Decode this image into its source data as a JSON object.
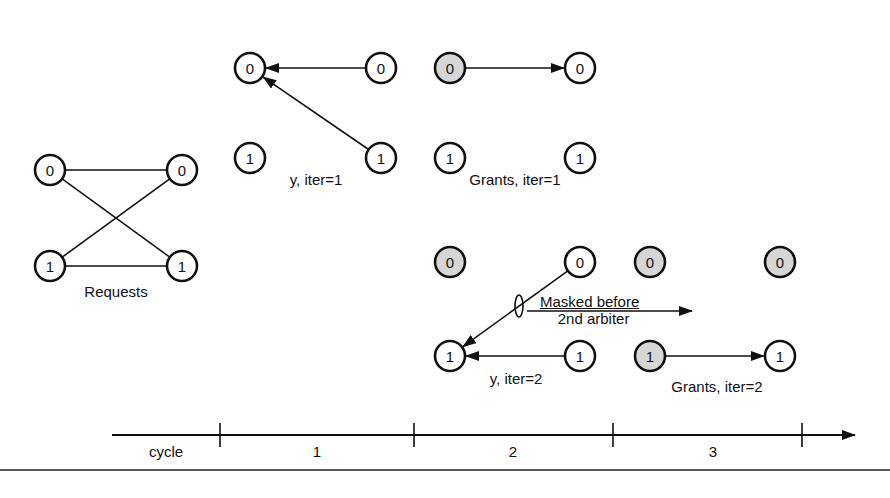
{
  "figure": {
    "colors": {
      "stroke": "#111111",
      "node_fill": "#ffffff",
      "node_granted_fill": "#d6d6d6",
      "background": "#ffffff"
    },
    "panels": [
      {
        "id": "requests",
        "label": "Requests",
        "nodes": [
          {
            "id": "req-in-0",
            "text": "0",
            "x": 50,
            "y": 170,
            "shaded": false
          },
          {
            "id": "req-out-0",
            "text": "0",
            "x": 182,
            "y": 170,
            "shaded": false
          },
          {
            "id": "req-in-1",
            "text": "1",
            "x": 50,
            "y": 266,
            "shaded": false
          },
          {
            "id": "req-out-1",
            "text": "1",
            "x": 182,
            "y": 266,
            "shaded": false
          }
        ],
        "edges": [
          {
            "from": "req-in-0",
            "to": "req-out-0",
            "arrow": false
          },
          {
            "from": "req-in-0",
            "to": "req-out-1",
            "arrow": false
          },
          {
            "from": "req-in-1",
            "to": "req-out-0",
            "arrow": false
          },
          {
            "from": "req-in-1",
            "to": "req-out-1",
            "arrow": false
          }
        ],
        "label_pos": {
          "x": 116,
          "y": 293
        }
      },
      {
        "id": "y-iter1",
        "label": "y, iter=1",
        "nodes": [
          {
            "id": "y1-l0",
            "text": "0",
            "x": 250,
            "y": 68,
            "shaded": false
          },
          {
            "id": "y1-r0",
            "text": "0",
            "x": 381,
            "y": 68,
            "shaded": false
          },
          {
            "id": "y1-l1",
            "text": "1",
            "x": 250,
            "y": 158,
            "shaded": false
          },
          {
            "id": "y1-r1",
            "text": "1",
            "x": 381,
            "y": 158,
            "shaded": false
          }
        ],
        "edges": [
          {
            "from": "y1-r0",
            "to": "y1-l0",
            "arrow": true
          },
          {
            "from": "y1-r1",
            "to": "y1-l0",
            "arrow": true
          }
        ],
        "label_pos": {
          "x": 316,
          "y": 181
        }
      },
      {
        "id": "grants-iter1",
        "label": "Grants, iter=1",
        "nodes": [
          {
            "id": "g1-l0",
            "text": "0",
            "x": 450,
            "y": 68,
            "shaded": true
          },
          {
            "id": "g1-r0",
            "text": "0",
            "x": 580,
            "y": 68,
            "shaded": false
          },
          {
            "id": "g1-l1",
            "text": "1",
            "x": 450,
            "y": 158,
            "shaded": false
          },
          {
            "id": "g1-r1",
            "text": "1",
            "x": 580,
            "y": 158,
            "shaded": false
          }
        ],
        "edges": [
          {
            "from": "g1-l0",
            "to": "g1-r0",
            "arrow": true
          }
        ],
        "label_pos": {
          "x": 515,
          "y": 181
        }
      },
      {
        "id": "y-iter2",
        "label": "y, iter=2",
        "nodes": [
          {
            "id": "y2-l0",
            "text": "0",
            "x": 450,
            "y": 262,
            "shaded": true
          },
          {
            "id": "y2-r0",
            "text": "0",
            "x": 580,
            "y": 262,
            "shaded": false
          },
          {
            "id": "y2-l1",
            "text": "1",
            "x": 450,
            "y": 356,
            "shaded": false
          },
          {
            "id": "y2-r1",
            "text": "1",
            "x": 580,
            "y": 356,
            "shaded": false
          }
        ],
        "edges": [
          {
            "from": "y2-r0",
            "to": "y2-l1",
            "arrow": true,
            "masked": true
          },
          {
            "from": "y2-r1",
            "to": "y2-l1",
            "arrow": true
          }
        ],
        "label_pos": {
          "x": 516,
          "y": 380
        }
      },
      {
        "id": "grants-iter2",
        "label": "Grants, iter=2",
        "nodes": [
          {
            "id": "g2-l0",
            "text": "0",
            "x": 650,
            "y": 262,
            "shaded": true
          },
          {
            "id": "g2-r0",
            "text": "0",
            "x": 780,
            "y": 262,
            "shaded": true
          },
          {
            "id": "g2-l1",
            "text": "1",
            "x": 650,
            "y": 356,
            "shaded": true
          },
          {
            "id": "g2-r1",
            "text": "1",
            "x": 780,
            "y": 356,
            "shaded": false
          }
        ],
        "edges": [
          {
            "from": "g2-l1",
            "to": "g2-r1",
            "arrow": true
          }
        ],
        "label_pos": {
          "x": 717,
          "y": 387
        }
      }
    ],
    "annotation": {
      "line1": "Masked before",
      "line2": "2nd arbiter"
    },
    "timeline": {
      "axis_label": "cycle",
      "cycles": [
        "1",
        "2",
        "3"
      ],
      "ticks_x": [
        220,
        414,
        613,
        802
      ],
      "y": 435,
      "x_start": 112,
      "x_end": 855
    }
  }
}
